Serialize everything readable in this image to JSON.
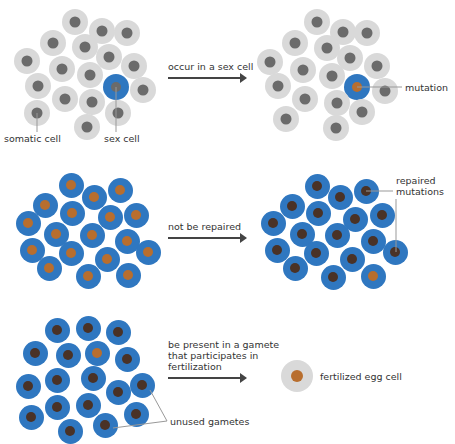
{
  "colors": {
    "somatic_outer": "#d9d9d9",
    "somatic_nucleus": "#6b6b6b",
    "sex_outer": "#2f77c0",
    "mutation_nucleus": "#b86e2e",
    "repaired_nucleus": "#4a3226",
    "text": "#333333",
    "arrow": "#444444",
    "leader": "#999999"
  },
  "rows": [
    {
      "arrow_label": "occur in a sex cell",
      "arrow": {
        "x": 168,
        "y": 77,
        "w": 74
      },
      "label_pos": {
        "x": 168,
        "y": 61
      },
      "left_cells": [
        {
          "x": 75,
          "y": 22,
          "t": "s"
        },
        {
          "x": 102,
          "y": 31,
          "t": "s"
        },
        {
          "x": 127,
          "y": 33,
          "t": "s"
        },
        {
          "x": 53,
          "y": 43,
          "t": "s"
        },
        {
          "x": 85,
          "y": 47,
          "t": "s"
        },
        {
          "x": 109,
          "y": 57,
          "t": "s"
        },
        {
          "x": 27,
          "y": 61,
          "t": "s"
        },
        {
          "x": 62,
          "y": 69,
          "t": "s"
        },
        {
          "x": 134,
          "y": 66,
          "t": "s"
        },
        {
          "x": 90,
          "y": 75,
          "t": "s"
        },
        {
          "x": 116,
          "y": 87,
          "t": "sex"
        },
        {
          "x": 38,
          "y": 86,
          "t": "s"
        },
        {
          "x": 143,
          "y": 90,
          "t": "s"
        },
        {
          "x": 65,
          "y": 99,
          "t": "s"
        },
        {
          "x": 92,
          "y": 102,
          "t": "s"
        },
        {
          "x": 118,
          "y": 113,
          "t": "s"
        },
        {
          "x": 37,
          "y": 113,
          "t": "s"
        },
        {
          "x": 87,
          "y": 127,
          "t": "s"
        }
      ],
      "right_cells": [
        {
          "x": 317,
          "y": 22,
          "t": "s"
        },
        {
          "x": 343,
          "y": 32,
          "t": "s"
        },
        {
          "x": 367,
          "y": 33,
          "t": "s"
        },
        {
          "x": 295,
          "y": 43,
          "t": "s"
        },
        {
          "x": 327,
          "y": 48,
          "t": "s"
        },
        {
          "x": 350,
          "y": 58,
          "t": "s"
        },
        {
          "x": 270,
          "y": 62,
          "t": "s"
        },
        {
          "x": 303,
          "y": 70,
          "t": "s"
        },
        {
          "x": 377,
          "y": 66,
          "t": "s"
        },
        {
          "x": 332,
          "y": 76,
          "t": "s"
        },
        {
          "x": 357,
          "y": 87,
          "t": "sexmut"
        },
        {
          "x": 278,
          "y": 86,
          "t": "s"
        },
        {
          "x": 385,
          "y": 91,
          "t": "s"
        },
        {
          "x": 305,
          "y": 99,
          "t": "s"
        },
        {
          "x": 337,
          "y": 103,
          "t": "s"
        },
        {
          "x": 362,
          "y": 112,
          "t": "s"
        },
        {
          "x": 286,
          "y": 119,
          "t": "s"
        },
        {
          "x": 336,
          "y": 128,
          "t": "s"
        }
      ],
      "annotations": [
        {
          "text": "somatic cell",
          "x": 4,
          "y": 133
        },
        {
          "text": "sex cell",
          "x": 104,
          "y": 133
        },
        {
          "text": "mutation",
          "x": 405,
          "y": 82
        }
      ]
    },
    {
      "arrow_label": "not be repaired",
      "arrow": {
        "x": 168,
        "y": 237,
        "w": 74
      },
      "label_pos": {
        "x": 168,
        "y": 221
      },
      "left_cells": [
        {
          "x": 71,
          "y": 185,
          "t": "m"
        },
        {
          "x": 94,
          "y": 197,
          "t": "m"
        },
        {
          "x": 120,
          "y": 190,
          "t": "m"
        },
        {
          "x": 45,
          "y": 205,
          "t": "m"
        },
        {
          "x": 72,
          "y": 213,
          "t": "m"
        },
        {
          "x": 110,
          "y": 217,
          "t": "m"
        },
        {
          "x": 136,
          "y": 215,
          "t": "m"
        },
        {
          "x": 28,
          "y": 223,
          "t": "m"
        },
        {
          "x": 56,
          "y": 234,
          "t": "m"
        },
        {
          "x": 92,
          "y": 235,
          "t": "m"
        },
        {
          "x": 127,
          "y": 241,
          "t": "m"
        },
        {
          "x": 32,
          "y": 250,
          "t": "m"
        },
        {
          "x": 71,
          "y": 253,
          "t": "m"
        },
        {
          "x": 107,
          "y": 259,
          "t": "m"
        },
        {
          "x": 148,
          "y": 252,
          "t": "m"
        },
        {
          "x": 49,
          "y": 268,
          "t": "m"
        },
        {
          "x": 88,
          "y": 276,
          "t": "m"
        },
        {
          "x": 128,
          "y": 275,
          "t": "m"
        }
      ],
      "right_cells": [
        {
          "x": 317,
          "y": 186,
          "t": "r"
        },
        {
          "x": 340,
          "y": 197,
          "t": "r"
        },
        {
          "x": 366,
          "y": 191,
          "t": "r"
        },
        {
          "x": 292,
          "y": 206,
          "t": "r"
        },
        {
          "x": 318,
          "y": 213,
          "t": "r"
        },
        {
          "x": 355,
          "y": 219,
          "t": "r"
        },
        {
          "x": 382,
          "y": 215,
          "t": "r"
        },
        {
          "x": 273,
          "y": 223,
          "t": "r"
        },
        {
          "x": 302,
          "y": 234,
          "t": "r"
        },
        {
          "x": 337,
          "y": 235,
          "t": "r"
        },
        {
          "x": 373,
          "y": 241,
          "t": "r"
        },
        {
          "x": 277,
          "y": 250,
          "t": "r"
        },
        {
          "x": 316,
          "y": 253,
          "t": "r"
        },
        {
          "x": 352,
          "y": 259,
          "t": "r"
        },
        {
          "x": 395,
          "y": 252,
          "t": "r"
        },
        {
          "x": 295,
          "y": 268,
          "t": "r"
        },
        {
          "x": 333,
          "y": 277,
          "t": "r"
        },
        {
          "x": 373,
          "y": 276,
          "t": "m"
        }
      ],
      "annotations": [
        {
          "text": "repaired\nmutations",
          "x": 396,
          "y": 175
        }
      ]
    },
    {
      "arrow_label": "be present in a gamete\nthat participates in\nfertilization",
      "arrow": {
        "x": 168,
        "y": 377,
        "w": 74
      },
      "label_pos": {
        "x": 168,
        "y": 339
      },
      "left_cells": [
        {
          "x": 57,
          "y": 330,
          "t": "r"
        },
        {
          "x": 88,
          "y": 328,
          "t": "r"
        },
        {
          "x": 118,
          "y": 332,
          "t": "r"
        },
        {
          "x": 35,
          "y": 353,
          "t": "r"
        },
        {
          "x": 68,
          "y": 355,
          "t": "r"
        },
        {
          "x": 97,
          "y": 353,
          "t": "m"
        },
        {
          "x": 127,
          "y": 359,
          "t": "r"
        },
        {
          "x": 28,
          "y": 386,
          "t": "r"
        },
        {
          "x": 57,
          "y": 380,
          "t": "r"
        },
        {
          "x": 93,
          "y": 378,
          "t": "r"
        },
        {
          "x": 118,
          "y": 392,
          "t": "r"
        },
        {
          "x": 142,
          "y": 385,
          "t": "r"
        },
        {
          "x": 31,
          "y": 417,
          "t": "r"
        },
        {
          "x": 57,
          "y": 407,
          "t": "r"
        },
        {
          "x": 88,
          "y": 405,
          "t": "r"
        },
        {
          "x": 136,
          "y": 414,
          "t": "r"
        },
        {
          "x": 70,
          "y": 431,
          "t": "r"
        },
        {
          "x": 105,
          "y": 425,
          "t": "r"
        }
      ],
      "right_cells": [
        {
          "x": 297,
          "y": 376,
          "t": "egg"
        }
      ],
      "annotations": [
        {
          "text": "unused gametes",
          "x": 170,
          "y": 416
        },
        {
          "text": "fertilized egg cell",
          "x": 320,
          "y": 371
        }
      ]
    }
  ],
  "leaders": [
    {
      "x1": 37,
      "y1": 113,
      "x2": 37,
      "y2": 132
    },
    {
      "x1": 116,
      "y1": 87,
      "x2": 116,
      "y2": 132
    },
    {
      "x1": 357,
      "y1": 87,
      "x2": 402,
      "y2": 87
    },
    {
      "x1": 366,
      "y1": 191,
      "x2": 393,
      "y2": 191
    },
    {
      "x1": 396,
      "y1": 199,
      "x2": 396,
      "y2": 252
    },
    {
      "x1": 150,
      "y1": 390,
      "x2": 167,
      "y2": 421
    },
    {
      "x1": 113,
      "y1": 428,
      "x2": 167,
      "y2": 421
    }
  ]
}
